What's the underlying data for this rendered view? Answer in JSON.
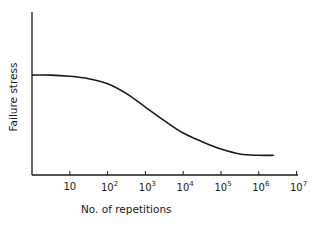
{
  "chart_data": {
    "type": "line",
    "title": "",
    "xlabel": "No. of repetitions",
    "ylabel": "Failure stress",
    "x_scale": "log",
    "x_ticks": [
      {
        "base": "10",
        "exp": ""
      },
      {
        "base": "10",
        "exp": "2"
      },
      {
        "base": "10",
        "exp": "3"
      },
      {
        "base": "10",
        "exp": "4"
      },
      {
        "base": "10",
        "exp": "5"
      },
      {
        "base": "10",
        "exp": "6"
      },
      {
        "base": "10",
        "exp": "7"
      }
    ],
    "xlim": [
      1,
      10000000
    ],
    "y_ticks": [],
    "ylim": [
      0,
      1
    ],
    "grid": false,
    "legend": null,
    "series": [
      {
        "name": "S-N curve",
        "color": "#1a1a1a",
        "points_log10x_y": [
          [
            0.0,
            0.81
          ],
          [
            0.5,
            0.81
          ],
          [
            1.0,
            0.8
          ],
          [
            1.5,
            0.78
          ],
          [
            2.0,
            0.74
          ],
          [
            2.5,
            0.66
          ],
          [
            3.0,
            0.55
          ],
          [
            3.5,
            0.44
          ],
          [
            4.0,
            0.34
          ],
          [
            4.5,
            0.27
          ],
          [
            5.0,
            0.21
          ],
          [
            5.5,
            0.17
          ],
          [
            6.0,
            0.16
          ],
          [
            6.4,
            0.16
          ]
        ]
      }
    ]
  }
}
